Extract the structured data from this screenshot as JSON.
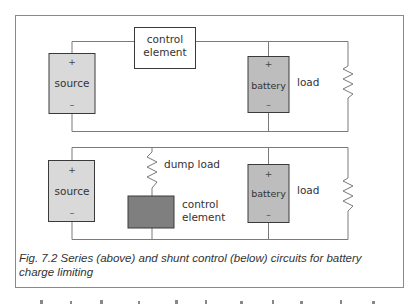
{
  "figure": {
    "caption_line1": "Fig. 7.2  Series (above) and shunt control (below) circuits for battery",
    "caption_line2": "charge limiting"
  },
  "series_circuit": {
    "source": {
      "label": "source",
      "plus": "+",
      "minus": "–"
    },
    "control_element": {
      "line1": "control",
      "line2": "element"
    },
    "battery": {
      "label": "battery",
      "plus": "+",
      "minus": "–"
    },
    "load": {
      "label": "load"
    }
  },
  "shunt_circuit": {
    "source": {
      "label": "source",
      "plus": "+",
      "minus": "–"
    },
    "dump_load": {
      "label": "dump load"
    },
    "control_element": {
      "line1": "control",
      "line2": "element"
    },
    "battery": {
      "label": "battery",
      "plus": "+",
      "minus": "–"
    },
    "load": {
      "label": "load"
    }
  },
  "colors": {
    "frame": "#8a8a8a",
    "wire": "#7a7a7a",
    "source_fill": "#d9d9d9",
    "battery_fill": "#bdbdbd",
    "shunt_control_fill": "#7f7f7f",
    "box_border": "#3a3a3a"
  },
  "cut_off_text": "…"
}
